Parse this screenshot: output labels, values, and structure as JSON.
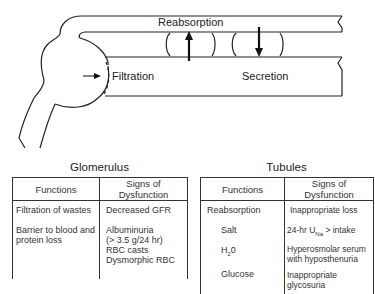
{
  "diagram": {
    "labels": {
      "reabsorption": "Reabsorption",
      "filtration": "Filtration",
      "secretion": "Secretion"
    }
  },
  "glomerulus": {
    "title": "Glomerulus",
    "headers": [
      "Functions",
      "Signs of Dysfunction"
    ],
    "functions": [
      "Filtration of wastes",
      "Barrier to blood and",
      "protein loss"
    ],
    "signs": [
      "Decreased GFR",
      "Albuminuria",
      "(> 3.5 g/24 hr)",
      "RBC casts",
      "Dysmorphic RBC"
    ]
  },
  "tubules": {
    "title": "Tubules",
    "headers": [
      "Functions",
      "Signs of Dysfunction"
    ],
    "functions": [
      "Reabsorption",
      "Salt",
      "H",
      "2",
      "0",
      "Glucose"
    ],
    "signs": [
      "Inappropriate loss",
      "24-hr U",
      "Na",
      " > intake",
      "Hyperosmolar serum",
      "with hyposthenuria",
      "Inappropriate",
      "glycosuria"
    ]
  }
}
